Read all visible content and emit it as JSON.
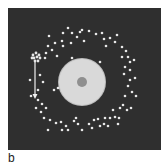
{
  "figure": {
    "panel_label": "b",
    "background_color": "#2f2f2f",
    "sphere": {
      "cx": 82,
      "cy": 82,
      "r": 23,
      "fill": "#d9d9d9",
      "nucleus_r": 5,
      "nucleus_fill": "#8f8f8f"
    },
    "cluster": {
      "cx": 36,
      "cy": 57,
      "fill": "#e6e6e6"
    },
    "arrow": {
      "x": 35,
      "y1": 62,
      "y2": 99,
      "color": "#f0f0f0"
    },
    "dot_color": "#e8e8e8",
    "dots": [
      [
        68,
        28
      ],
      [
        63,
        33
      ],
      [
        72,
        33
      ],
      [
        77,
        37
      ],
      [
        82,
        30
      ],
      [
        89,
        31
      ],
      [
        96,
        34
      ],
      [
        102,
        33
      ],
      [
        104,
        39
      ],
      [
        110,
        38
      ],
      [
        115,
        42
      ],
      [
        117,
        35
      ],
      [
        49,
        36
      ],
      [
        55,
        43
      ],
      [
        62,
        41
      ],
      [
        71,
        43
      ],
      [
        52,
        50
      ],
      [
        48,
        46
      ],
      [
        46,
        53
      ],
      [
        57,
        56
      ],
      [
        63,
        46
      ],
      [
        106,
        46
      ],
      [
        80,
        32
      ],
      [
        84,
        41
      ],
      [
        100,
        62
      ],
      [
        72,
        58
      ],
      [
        122,
        47
      ],
      [
        126,
        51
      ],
      [
        128,
        57
      ],
      [
        130,
        62
      ],
      [
        134,
        60
      ],
      [
        122,
        57
      ],
      [
        125,
        67
      ],
      [
        130,
        70
      ],
      [
        124,
        74
      ],
      [
        130,
        80
      ],
      [
        135,
        78
      ],
      [
        128,
        86
      ],
      [
        132,
        92
      ],
      [
        125,
        96
      ],
      [
        136,
        96
      ],
      [
        123,
        105
      ],
      [
        131,
        108
      ],
      [
        127,
        110
      ],
      [
        115,
        117
      ],
      [
        119,
        118
      ],
      [
        110,
        118
      ],
      [
        105,
        118
      ],
      [
        98,
        119
      ],
      [
        94,
        120
      ],
      [
        89,
        124
      ],
      [
        92,
        128
      ],
      [
        100,
        126
      ],
      [
        104,
        124
      ],
      [
        108,
        126
      ],
      [
        118,
        124
      ],
      [
        120,
        108
      ],
      [
        113,
        110
      ],
      [
        82,
        130
      ],
      [
        74,
        121
      ],
      [
        78,
        124
      ],
      [
        66,
        126
      ],
      [
        62,
        130
      ],
      [
        68,
        130
      ],
      [
        56,
        123
      ],
      [
        50,
        120
      ],
      [
        44,
        118
      ],
      [
        41,
        112
      ],
      [
        46,
        108
      ],
      [
        42,
        104
      ],
      [
        48,
        130
      ],
      [
        76,
        118
      ],
      [
        61,
        122
      ],
      [
        31,
        96
      ],
      [
        38,
        100
      ],
      [
        36,
        108
      ],
      [
        30,
        80
      ],
      [
        40,
        75
      ],
      [
        43,
        82
      ],
      [
        38,
        90
      ],
      [
        54,
        90
      ],
      [
        58,
        88
      ],
      [
        45,
        58
      ]
    ],
    "cluster_dots": [
      [
        33,
        55
      ],
      [
        36,
        53
      ],
      [
        39,
        55
      ],
      [
        34,
        58
      ],
      [
        37,
        57
      ],
      [
        40,
        58
      ],
      [
        35,
        61
      ],
      [
        38,
        61
      ],
      [
        32,
        58
      ]
    ]
  }
}
